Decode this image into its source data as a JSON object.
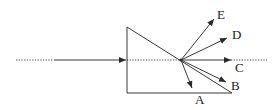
{
  "diagram": {
    "colors": {
      "line": "#3a3a3a",
      "label": "#1a1a1a",
      "background": "#ffffff"
    },
    "prism": {
      "vertices": [
        [
          127,
          27
        ],
        [
          127,
          93
        ],
        [
          232,
          93
        ]
      ]
    },
    "incident_ray": {
      "dotted_start": [
        16,
        60
      ],
      "solid_start": [
        55,
        60
      ],
      "arrow_at": [
        125,
        60
      ],
      "inside_dotted_end": [
        181,
        60
      ]
    },
    "exit_point": [
      181,
      60
    ],
    "rays": [
      {
        "label": "A",
        "tip": [
          192,
          88
        ],
        "label_pos": [
          199,
          104
        ]
      },
      {
        "label": "B",
        "tip": [
          226,
          82
        ],
        "label_pos": [
          235,
          90
        ]
      },
      {
        "label": "C",
        "tip": [
          231,
          60
        ],
        "label_pos": [
          239,
          72
        ]
      },
      {
        "label": "D",
        "tip": [
          227,
          38
        ],
        "label_pos": [
          236,
          39
        ]
      },
      {
        "label": "E",
        "tip": [
          214,
          19
        ],
        "label_pos": [
          219,
          19
        ]
      }
    ],
    "normal_extension": {
      "start": [
        231,
        60
      ],
      "end": [
        267,
        60
      ]
    }
  }
}
